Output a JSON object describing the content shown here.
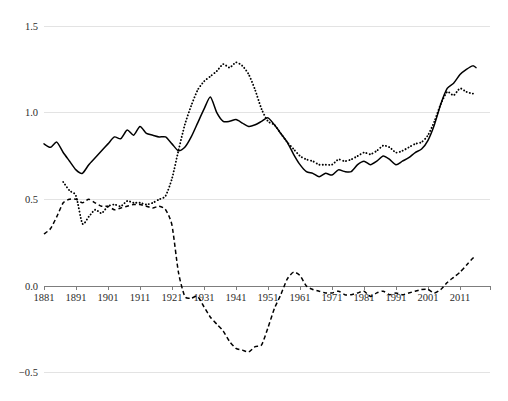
{
  "chart_data": {
    "type": "line",
    "title": "",
    "subtitle": "",
    "xlabel": "",
    "ylabel": "",
    "xlim": [
      1881,
      2017
    ],
    "ylim": [
      -0.5,
      1.5
    ],
    "grid": true,
    "legend": "none",
    "yticks": [
      "1.5",
      "1.0",
      "0.5",
      "0.0",
      "−0.5"
    ],
    "ytick_values": [
      1.5,
      1.0,
      0.5,
      0.0,
      -0.5
    ],
    "xticks": [
      "1881",
      "1891",
      "1901",
      "1911",
      "1921",
      "1931",
      "1941",
      "1951",
      "1961",
      "1971",
      "1981",
      "1991",
      "2001",
      "2011"
    ],
    "xtick_values": [
      1881,
      1891,
      1901,
      1911,
      1921,
      1931,
      1941,
      1951,
      1961,
      1971,
      1981,
      1991,
      2001,
      2011
    ],
    "series": [
      {
        "name": "series-solid",
        "style": "solid",
        "color": "#000000",
        "x": [
          1881,
          1883,
          1885,
          1887,
          1889,
          1891,
          1893,
          1895,
          1897,
          1899,
          1901,
          1903,
          1905,
          1907,
          1909,
          1911,
          1913,
          1915,
          1917,
          1919,
          1921,
          1923,
          1925,
          1927,
          1929,
          1931,
          1933,
          1935,
          1937,
          1939,
          1941,
          1943,
          1945,
          1947,
          1949,
          1951,
          1953,
          1955,
          1957,
          1959,
          1961,
          1963,
          1965,
          1967,
          1969,
          1971,
          1973,
          1975,
          1977,
          1979,
          1981,
          1983,
          1985,
          1987,
          1989,
          1991,
          1993,
          1995,
          1997,
          1999,
          2001,
          2003,
          2005,
          2007,
          2009,
          2011,
          2013,
          2015,
          2016
        ],
        "y": [
          0.82,
          0.8,
          0.83,
          0.77,
          0.72,
          0.67,
          0.65,
          0.7,
          0.74,
          0.78,
          0.82,
          0.86,
          0.85,
          0.9,
          0.87,
          0.92,
          0.88,
          0.87,
          0.86,
          0.86,
          0.82,
          0.78,
          0.8,
          0.86,
          0.94,
          1.02,
          1.09,
          1.0,
          0.95,
          0.95,
          0.96,
          0.94,
          0.92,
          0.93,
          0.95,
          0.97,
          0.93,
          0.88,
          0.83,
          0.76,
          0.7,
          0.66,
          0.65,
          0.63,
          0.65,
          0.64,
          0.67,
          0.66,
          0.66,
          0.7,
          0.72,
          0.7,
          0.72,
          0.75,
          0.73,
          0.7,
          0.72,
          0.74,
          0.77,
          0.79,
          0.84,
          0.93,
          1.05,
          1.14,
          1.17,
          1.22,
          1.25,
          1.27,
          1.26
        ],
        "comment": "Top income share series, solid line, spans full 1881-2016 range"
      },
      {
        "name": "series-dotted",
        "style": "dotted",
        "color": "#000000",
        "x": [
          1887,
          1889,
          1891,
          1893,
          1895,
          1897,
          1899,
          1901,
          1903,
          1905,
          1907,
          1909,
          1911,
          1913,
          1915,
          1917,
          1919,
          1921,
          1923,
          1925,
          1927,
          1929,
          1931,
          1933,
          1935,
          1937,
          1939,
          1941,
          1943,
          1945,
          1947,
          1949,
          1951,
          1953,
          1955,
          1957,
          1959,
          1961,
          1963,
          1965,
          1967,
          1969,
          1971,
          1973,
          1975,
          1977,
          1979,
          1981,
          1983,
          1985,
          1987,
          1989,
          1991,
          1993,
          1995,
          1997,
          1999,
          2001,
          2003,
          2005,
          2007,
          2009,
          2011,
          2013,
          2015,
          2016
        ],
        "y": [
          0.6,
          0.55,
          0.52,
          0.36,
          0.4,
          0.44,
          0.42,
          0.46,
          0.47,
          0.46,
          0.49,
          0.48,
          0.48,
          0.47,
          0.48,
          0.5,
          0.52,
          0.62,
          0.78,
          0.93,
          1.04,
          1.13,
          1.18,
          1.21,
          1.24,
          1.28,
          1.26,
          1.29,
          1.27,
          1.22,
          1.13,
          1.02,
          0.95,
          0.93,
          0.88,
          0.83,
          0.79,
          0.75,
          0.73,
          0.72,
          0.7,
          0.7,
          0.7,
          0.73,
          0.72,
          0.73,
          0.75,
          0.77,
          0.76,
          0.78,
          0.81,
          0.8,
          0.77,
          0.78,
          0.8,
          0.82,
          0.83,
          0.87,
          0.95,
          1.05,
          1.12,
          1.1,
          1.14,
          1.12,
          1.11,
          1.11
        ],
        "comment": "Second series, dotted line, begins around 1887"
      },
      {
        "name": "series-dashed",
        "style": "dashed",
        "color": "#000000",
        "x": [
          1881,
          1883,
          1885,
          1887,
          1889,
          1891,
          1893,
          1895,
          1897,
          1899,
          1901,
          1903,
          1905,
          1907,
          1909,
          1911,
          1913,
          1915,
          1917,
          1919,
          1921,
          1923,
          1925,
          1927,
          1929,
          1931,
          1933,
          1935,
          1937,
          1939,
          1941,
          1943,
          1945,
          1947,
          1949,
          1951,
          1953,
          1955,
          1957,
          1959,
          1961,
          1963,
          1965,
          1967,
          1969,
          1971,
          1973,
          1975,
          1977,
          1979,
          1981,
          1983,
          1985,
          1987,
          1989,
          1991,
          1993,
          1995,
          1997,
          1999,
          2001,
          2003,
          2005,
          2007,
          2009,
          2011,
          2013,
          2015,
          2016
        ],
        "y": [
          0.3,
          0.33,
          0.4,
          0.48,
          0.5,
          0.5,
          0.48,
          0.5,
          0.48,
          0.46,
          0.46,
          0.44,
          0.45,
          0.46,
          0.47,
          0.47,
          0.46,
          0.45,
          0.46,
          0.44,
          0.35,
          0.08,
          -0.06,
          -0.07,
          -0.06,
          -0.12,
          -0.18,
          -0.22,
          -0.26,
          -0.32,
          -0.36,
          -0.37,
          -0.38,
          -0.35,
          -0.34,
          -0.24,
          -0.13,
          -0.05,
          0.04,
          0.08,
          0.06,
          0.0,
          -0.02,
          -0.03,
          -0.04,
          -0.04,
          -0.03,
          -0.05,
          -0.05,
          -0.04,
          -0.03,
          -0.06,
          -0.04,
          -0.03,
          -0.05,
          -0.04,
          -0.05,
          -0.04,
          -0.03,
          -0.02,
          -0.02,
          -0.04,
          -0.02,
          0.02,
          0.05,
          0.08,
          0.12,
          0.16,
          0.17
        ],
        "comment": "Third series, dashed line, crosses zero around 1922"
      }
    ]
  },
  "figure": {
    "background_color": "#ffffff",
    "gridline_color": "#e3e3e3",
    "axis_color": "#7d7d7d",
    "line_color": "#000000"
  }
}
